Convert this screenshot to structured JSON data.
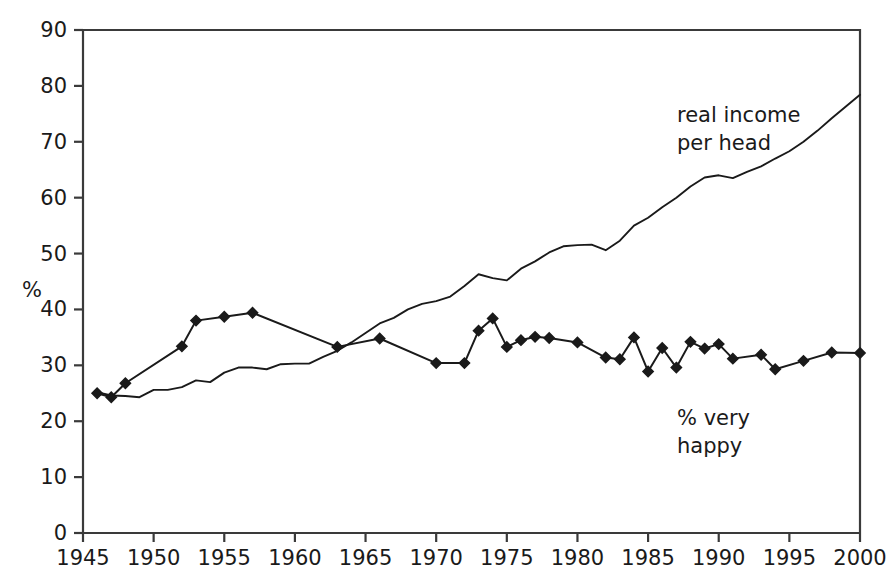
{
  "chart_data": {
    "type": "line",
    "title": "",
    "xlabel": "",
    "ylabel": "%",
    "xlim": [
      1945,
      2000
    ],
    "ylim": [
      0,
      90
    ],
    "xticks": [
      1945,
      1950,
      1955,
      1960,
      1965,
      1970,
      1975,
      1980,
      1985,
      1990,
      1995,
      2000
    ],
    "yticks": [
      0,
      10,
      20,
      30,
      40,
      50,
      60,
      70,
      80,
      90
    ],
    "grid": false,
    "legend_position": "inline-annotations",
    "annotations": [
      {
        "name": "real-income-per-head",
        "text": "real income\nper head",
        "line1": "real income",
        "line2": "per head",
        "x": 1974,
        "y": 72
      },
      {
        "name": "percent-very-happy",
        "text": "% very\nhappy",
        "line1": "% very",
        "line2": "happy",
        "x": 1983,
        "y": 22
      }
    ],
    "series": [
      {
        "name": "real income per head",
        "markers": false,
        "color": "#1a1a1a",
        "points": [
          {
            "x": 1946,
            "y": 25.2
          },
          {
            "x": 1947,
            "y": 24.6
          },
          {
            "x": 1948,
            "y": 24.5
          },
          {
            "x": 1949,
            "y": 24.3
          },
          {
            "x": 1950,
            "y": 25.6
          },
          {
            "x": 1951,
            "y": 25.6
          },
          {
            "x": 1952,
            "y": 26.1
          },
          {
            "x": 1953,
            "y": 27.3
          },
          {
            "x": 1954,
            "y": 27.0
          },
          {
            "x": 1955,
            "y": 28.7
          },
          {
            "x": 1956,
            "y": 29.6
          },
          {
            "x": 1957,
            "y": 29.6
          },
          {
            "x": 1958,
            "y": 29.3
          },
          {
            "x": 1959,
            "y": 30.2
          },
          {
            "x": 1960,
            "y": 30.3
          },
          {
            "x": 1961,
            "y": 30.3
          },
          {
            "x": 1962,
            "y": 31.5
          },
          {
            "x": 1963,
            "y": 32.6
          },
          {
            "x": 1964,
            "y": 34.1
          },
          {
            "x": 1965,
            "y": 35.8
          },
          {
            "x": 1966,
            "y": 37.5
          },
          {
            "x": 1967,
            "y": 38.5
          },
          {
            "x": 1968,
            "y": 40.0
          },
          {
            "x": 1969,
            "y": 41.0
          },
          {
            "x": 1970,
            "y": 41.5
          },
          {
            "x": 1971,
            "y": 42.3
          },
          {
            "x": 1972,
            "y": 44.2
          },
          {
            "x": 1973,
            "y": 46.3
          },
          {
            "x": 1974,
            "y": 45.6
          },
          {
            "x": 1975,
            "y": 45.2
          },
          {
            "x": 1976,
            "y": 47.3
          },
          {
            "x": 1977,
            "y": 48.6
          },
          {
            "x": 1978,
            "y": 50.2
          },
          {
            "x": 1979,
            "y": 51.3
          },
          {
            "x": 1980,
            "y": 51.5
          },
          {
            "x": 1981,
            "y": 51.6
          },
          {
            "x": 1982,
            "y": 50.6
          },
          {
            "x": 1983,
            "y": 52.3
          },
          {
            "x": 1984,
            "y": 55.0
          },
          {
            "x": 1985,
            "y": 56.4
          },
          {
            "x": 1986,
            "y": 58.3
          },
          {
            "x": 1987,
            "y": 60.0
          },
          {
            "x": 1988,
            "y": 62.0
          },
          {
            "x": 1989,
            "y": 63.6
          },
          {
            "x": 1990,
            "y": 64.0
          },
          {
            "x": 1991,
            "y": 63.5
          },
          {
            "x": 1992,
            "y": 64.6
          },
          {
            "x": 1993,
            "y": 65.6
          },
          {
            "x": 1994,
            "y": 67.0
          },
          {
            "x": 1995,
            "y": 68.3
          },
          {
            "x": 1996,
            "y": 70.0
          },
          {
            "x": 1997,
            "y": 72.0
          },
          {
            "x": 1998,
            "y": 74.2
          },
          {
            "x": 1999,
            "y": 76.3
          },
          {
            "x": 2000,
            "y": 78.4
          }
        ]
      },
      {
        "name": "% very happy",
        "markers": true,
        "color": "#1a1a1a",
        "points": [
          {
            "x": 1946,
            "y": 25.0
          },
          {
            "x": 1947,
            "y": 24.3
          },
          {
            "x": 1948,
            "y": 26.8
          },
          {
            "x": 1952,
            "y": 33.4
          },
          {
            "x": 1953,
            "y": 38.0
          },
          {
            "x": 1955,
            "y": 38.7
          },
          {
            "x": 1957,
            "y": 39.4
          },
          {
            "x": 1963,
            "y": 33.3
          },
          {
            "x": 1966,
            "y": 34.8
          },
          {
            "x": 1970,
            "y": 30.4
          },
          {
            "x": 1972,
            "y": 30.4
          },
          {
            "x": 1973,
            "y": 36.2
          },
          {
            "x": 1974,
            "y": 38.4
          },
          {
            "x": 1975,
            "y": 33.3
          },
          {
            "x": 1976,
            "y": 34.5
          },
          {
            "x": 1977,
            "y": 35.1
          },
          {
            "x": 1978,
            "y": 34.9
          },
          {
            "x": 1980,
            "y": 34.1
          },
          {
            "x": 1982,
            "y": 31.4
          },
          {
            "x": 1983,
            "y": 31.1
          },
          {
            "x": 1984,
            "y": 35.0
          },
          {
            "x": 1985,
            "y": 28.9
          },
          {
            "x": 1986,
            "y": 33.1
          },
          {
            "x": 1987,
            "y": 29.6
          },
          {
            "x": 1988,
            "y": 34.2
          },
          {
            "x": 1989,
            "y": 33.0
          },
          {
            "x": 1990,
            "y": 33.8
          },
          {
            "x": 1991,
            "y": 31.2
          },
          {
            "x": 1993,
            "y": 31.9
          },
          {
            "x": 1994,
            "y": 29.3
          },
          {
            "x": 1996,
            "y": 30.8
          },
          {
            "x": 1998,
            "y": 32.3
          },
          {
            "x": 2000,
            "y": 32.2
          }
        ]
      }
    ]
  },
  "axis": {
    "y_title": "%",
    "x_tick_labels": [
      "1945",
      "1950",
      "1955",
      "1960",
      "1965",
      "1970",
      "1975",
      "1980",
      "1985",
      "1990",
      "1995",
      "2000"
    ],
    "y_tick_labels": [
      "90",
      "80",
      "70",
      "60",
      "50",
      "40",
      "30",
      "20",
      "10",
      "0"
    ]
  },
  "labels": {
    "income_line1": "real income",
    "income_line2": "per head",
    "happy_line1": "% very",
    "happy_line2": "happy"
  }
}
